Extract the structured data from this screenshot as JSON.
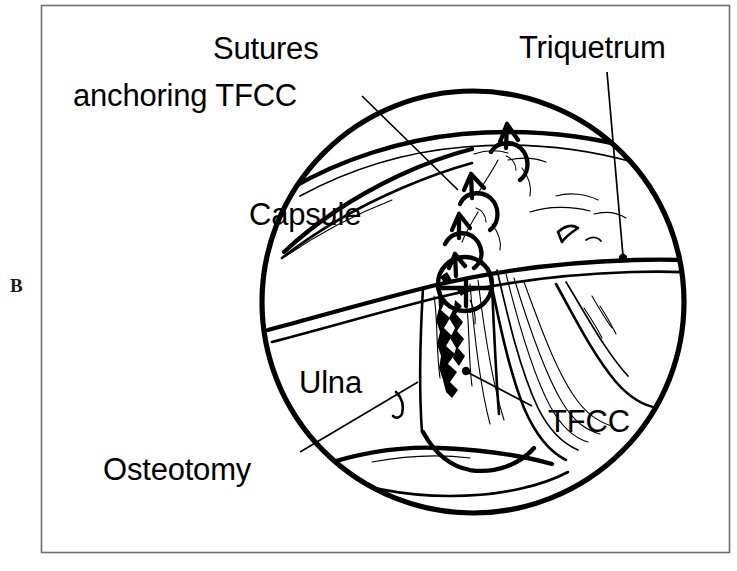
{
  "figure": {
    "panel_letter": "B",
    "background_color": "#ffffff",
    "ink_color": "#000000",
    "frame_border_color": "#6e6e6e"
  },
  "scope_view": {
    "shape": "circle",
    "center_x": 473,
    "center_y": 302,
    "radius": 211
  },
  "annotations": {
    "sutures_anchoring_tfcc": {
      "line1": "Sutures",
      "line2": "anchoring TFCC"
    },
    "triquetrum": "Triquetrum",
    "capsule": "Capsule",
    "ulna": "Ulna",
    "osteotomy": "Osteotomy",
    "tfcc": "TFCC"
  }
}
